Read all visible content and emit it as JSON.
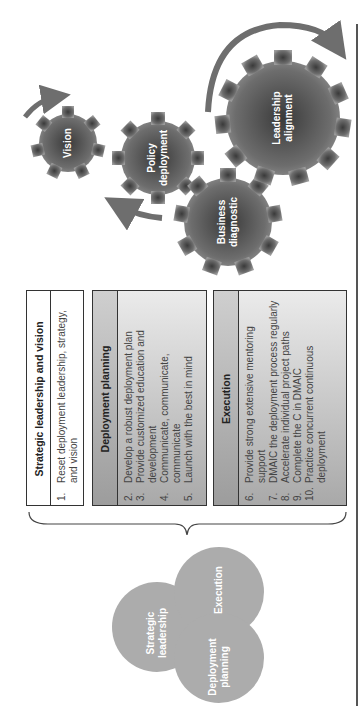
{
  "gears": [
    {
      "label": "Vision"
    },
    {
      "label": "Policy deployment",
      "lines": [
        "Policy",
        "deployment"
      ]
    },
    {
      "label": "Business diagnostic",
      "lines": [
        "Business",
        "diagnostic"
      ]
    },
    {
      "label": "Leadership alignment",
      "lines": [
        "Leadership",
        "alignment"
      ]
    }
  ],
  "tables": [
    {
      "title": "Strategic leadership and vision",
      "items": [
        {
          "num": "1.",
          "text": "Reset deployment leadership, strategy, and vision"
        }
      ]
    },
    {
      "title": "Deployment planning",
      "items": [
        {
          "num": "2.",
          "text": "Develop a robust deployment plan"
        },
        {
          "num": "3.",
          "text": "Provide customized education and development"
        },
        {
          "num": "4.",
          "text": "Communicate, communicate, communicate"
        },
        {
          "num": "5.",
          "text": "Launch with the best in mind"
        }
      ]
    },
    {
      "title": "Execution",
      "items": [
        {
          "num": "6.",
          "text": "Provide strong extensive mentoring support"
        },
        {
          "num": "7.",
          "text": "DMAIC the deployment process regularly"
        },
        {
          "num": "8.",
          "text": "Accelerate individual project paths"
        },
        {
          "num": "9.",
          "text": "Complete the C in DMAIC"
        },
        {
          "num": "10.",
          "text": "Practice concurrent continuous deployment"
        }
      ]
    }
  ],
  "venn": [
    {
      "label": "Strategic leadership",
      "lines": [
        "Strategic",
        "leadership"
      ]
    },
    {
      "label": "Execution"
    },
    {
      "label": "Deployment planning",
      "lines": [
        "Deployment",
        "planning"
      ]
    }
  ],
  "colors": {
    "gear": "#5a5a5a",
    "arrow": "#6e6e6e",
    "venn": "#8c8c8c",
    "border": "#333333"
  }
}
